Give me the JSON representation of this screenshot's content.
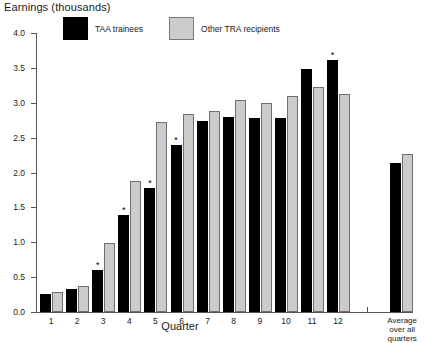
{
  "chart_data": {
    "type": "bar",
    "title": "",
    "ylabel": "Earnings (thousands)",
    "xlabel": "Quarter",
    "ylim": [
      0.0,
      4.0
    ],
    "ytick_labels": [
      "0.0",
      "0.5",
      "1.0",
      "1.5",
      "2.0",
      "2.5",
      "3.0",
      "3.5",
      "4.0"
    ],
    "ytick_values": [
      0.0,
      0.5,
      1.0,
      1.5,
      2.0,
      2.5,
      3.0,
      3.5,
      4.0
    ],
    "grid": false,
    "legend_position": "top-left",
    "categories": [
      "1",
      "2",
      "3",
      "4",
      "5",
      "6",
      "7",
      "8",
      "9",
      "10",
      "11",
      "12",
      "Average over all quarters"
    ],
    "series": [
      {
        "name": "TAA trainees",
        "color": "#000000",
        "values": [
          0.26,
          0.33,
          0.6,
          1.39,
          1.78,
          2.39,
          2.74,
          2.79,
          2.78,
          2.78,
          3.48,
          3.62,
          2.13
        ],
        "significance_markers": [
          false,
          false,
          true,
          true,
          true,
          true,
          false,
          false,
          false,
          false,
          false,
          true,
          false
        ]
      },
      {
        "name": "Other TRA recipients",
        "color": "#cbcbcb",
        "values": [
          0.28,
          0.38,
          0.99,
          1.88,
          2.73,
          2.84,
          2.88,
          3.04,
          3.0,
          3.09,
          3.22,
          3.13,
          2.26
        ],
        "significance_markers": [
          false,
          false,
          false,
          false,
          false,
          false,
          false,
          false,
          false,
          false,
          false,
          false,
          false
        ]
      }
    ],
    "annotation_symbol": "*"
  },
  "legend": {
    "items": [
      {
        "label": "TAA trainees",
        "swatch": "black-square-swatch"
      },
      {
        "label": "Other TRA recipients",
        "swatch": "gray-square-swatch"
      }
    ]
  },
  "axis_titles": {
    "y": "Earnings (thousands)",
    "x": "Quarter"
  },
  "average_label_lines": [
    "Average",
    "over all",
    "quarters"
  ]
}
